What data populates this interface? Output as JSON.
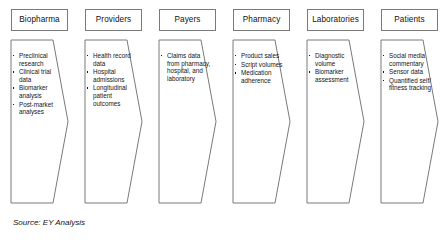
{
  "figure": {
    "source_caption": "Source: EY Analysis",
    "stroke_color": "#7a7a7a",
    "text_color": "#141414",
    "background_color": "#ffffff"
  },
  "columns": [
    {
      "header": "Biopharma",
      "items": [
        "Preclinical research",
        "Clinical trial data",
        "Biomarker analysis",
        "Post-market analyses"
      ]
    },
    {
      "header": "Providers",
      "items": [
        "Health record data",
        "Hospital admissions",
        "Longitudinal patient outcomes"
      ]
    },
    {
      "header": "Payers",
      "items": [
        "Claims data from pharmacy, hospital, and laboratory"
      ]
    },
    {
      "header": "Pharmacy",
      "items": [
        "Product sales",
        "Script volumes",
        "Medication adherence"
      ]
    },
    {
      "header": "Laboratories",
      "items": [
        "Diagnostic volume",
        "Biomarker assessment"
      ]
    },
    {
      "header": "Patients",
      "items": [
        "Social media commentary",
        "Sensor data",
        "Quantified self/ fitness tracking"
      ]
    }
  ]
}
